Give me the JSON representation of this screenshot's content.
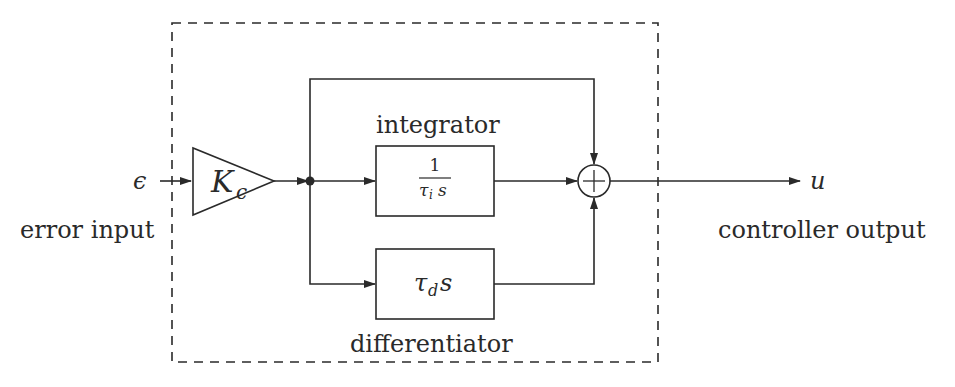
{
  "diagram": {
    "type": "block-diagram",
    "input": {
      "symbol": "ϵ",
      "label": "error input"
    },
    "gain_block": {
      "symbol": "K",
      "subscript": "c",
      "shape": "triangle"
    },
    "integrator": {
      "label": "integrator",
      "numerator": "1",
      "denominator_symbol": "τ",
      "denominator_subscript": "i",
      "denominator_var": "s"
    },
    "differentiator": {
      "label": "differentiator",
      "symbol": "τ",
      "subscript": "d",
      "var": "s"
    },
    "summing_junction": {
      "symbol": "+",
      "inputs": [
        "proportional (top)",
        "integrator (left)",
        "differentiator (bottom)"
      ]
    },
    "output": {
      "symbol": "u",
      "label": "controller output"
    },
    "colors": {
      "line": "#2a2a2a",
      "background": "#ffffff"
    }
  }
}
